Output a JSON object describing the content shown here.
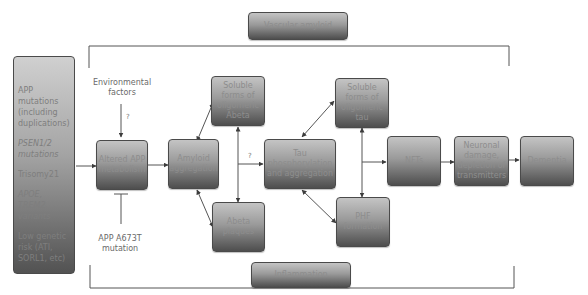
{
  "diagram": {
    "top_banner": "Vascular amyloid",
    "bottom_banner": "Inflammation",
    "risk_factors": [
      "APP mutations (including duplications)",
      "PSEN1/2 mutations",
      "Trisomy21",
      "APOE, TREM2 variants",
      "Low genetic risk (ATI, SORL1, etc)"
    ],
    "environmental_factors": "Environmental factors",
    "protective_mutation": "APP A673T mutation",
    "question_mark": "?",
    "nodes": {
      "altered_app": "Altered APP metabolism",
      "amyloid_aggregation": "Amyloid aggregation",
      "soluble_abeta": "Soluble forms of oligomeric Abeta",
      "abeta_plaques": "Abeta plaques",
      "tau": "Tau phosphorylation and aggregation",
      "soluble_tau": "Soluble forms of oligomeric tau",
      "phf": "PHF formation",
      "nfts": "NFTs",
      "neuronal_damage": "Neuronal damage, depletion of transmitters",
      "dementia": "Dementia"
    },
    "colors": {
      "box_top": "#c4c4c4",
      "box_bottom": "#4e4e4e",
      "line": "#4a4a4a",
      "text": "#6a6a6a"
    }
  }
}
